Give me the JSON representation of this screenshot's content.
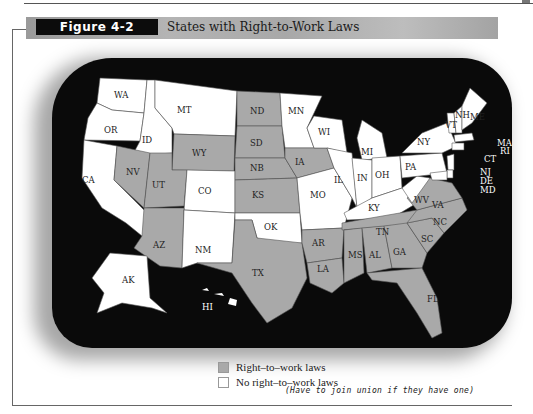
{
  "figure": {
    "label": "Figure 4-2",
    "title": "States with Right-to-Work Laws"
  },
  "colors": {
    "right_to_work": "#a9a9a9",
    "no_right_to_work": "#ffffff",
    "background_water": "#0a0a0a",
    "banner": "#a8a8a8"
  },
  "legend": {
    "items": [
      {
        "label": "Right–to–work laws",
        "color": "#a9a9a9"
      },
      {
        "label": "No right–to–work laws",
        "color": "#ffffff"
      }
    ],
    "handwritten_note": "(Have to join union if they have one)"
  },
  "states": {
    "right_to_work": [
      "ND",
      "SD",
      "NB",
      "KS",
      "IA",
      "WY",
      "NV",
      "UT",
      "AZ",
      "TX",
      "OK_excluded",
      "AR",
      "LA",
      "MS",
      "AL",
      "TN",
      "GA",
      "SC",
      "NC",
      "VA",
      "FL"
    ],
    "no_right_to_work": [
      "WA",
      "OR",
      "CA",
      "ID",
      "MT",
      "CO",
      "NM",
      "OK",
      "MN",
      "WI",
      "MI",
      "IL",
      "IN",
      "OH",
      "MO",
      "KY",
      "WV",
      "PA",
      "NY",
      "VT",
      "NH",
      "ME",
      "MA",
      "RI",
      "CT",
      "NJ",
      "DE",
      "MD",
      "AK",
      "HI"
    ]
  },
  "labels": {
    "WA": "WA",
    "OR": "OR",
    "CA": "CA",
    "ID": "ID",
    "MT": "MT",
    "WY": "WY",
    "NV": "NV",
    "UT": "UT",
    "CO": "CO",
    "AZ": "AZ",
    "NM": "NM",
    "ND": "ND",
    "SD": "SD",
    "NB": "NB",
    "KS": "KS",
    "OK": "OK",
    "TX": "TX",
    "MN": "MN",
    "IA": "IA",
    "MO": "MO",
    "AR": "AR",
    "LA": "LA",
    "WI": "WI",
    "IL": "IL",
    "MI": "MI",
    "IN": "IN",
    "OH": "OH",
    "KY": "KY",
    "TN": "TN",
    "MS": "MS",
    "AL": "AL",
    "GA": "GA",
    "FL": "FL",
    "SC": "SC",
    "NC": "NC",
    "VA": "VA",
    "WV": "WV",
    "PA": "PA",
    "NY": "NY",
    "VT": "VT",
    "NH": "NH",
    "ME": "ME",
    "MA": "MA",
    "RI": "RI",
    "CT": "CT",
    "NJ": "NJ",
    "DE": "DE",
    "MD": "MD",
    "AK": "AK",
    "HI": "HI"
  }
}
